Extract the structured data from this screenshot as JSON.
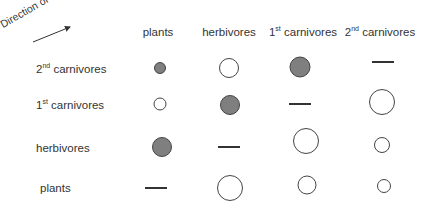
{
  "diagram": {
    "axis_label": "Direction of impact",
    "columns": [
      {
        "id": "plants",
        "label": "plants",
        "sup": "",
        "label_rest": "",
        "x": 158
      },
      {
        "id": "herbivores",
        "label": "herbivores",
        "sup": "",
        "label_rest": "",
        "x": 229
      },
      {
        "id": "carn1",
        "label": "1",
        "sup": "st",
        "label_rest": " carnivores",
        "x": 303
      },
      {
        "id": "carn2",
        "label": "2",
        "sup": "nd",
        "label_rest": " carnivores",
        "x": 380
      }
    ],
    "rows": [
      {
        "id": "carn2",
        "label": "2",
        "sup": "nd",
        "label_rest": " carnivores",
        "y": 69
      },
      {
        "id": "carn1",
        "label": "1",
        "sup": "st",
        "label_rest": " carnivores",
        "y": 105
      },
      {
        "id": "herbivores",
        "label": "herbivores",
        "sup": "",
        "label_rest": "",
        "y": 148
      },
      {
        "id": "plants",
        "label": "plants",
        "sup": "",
        "label_rest": "",
        "y": 188
      }
    ],
    "cells": [
      {
        "row": "carn2",
        "col": "plants",
        "type": "filled",
        "size": 12,
        "x": 160,
        "y": 68
      },
      {
        "row": "carn2",
        "col": "herbivores",
        "type": "open",
        "size": 20,
        "x": 229,
        "y": 68
      },
      {
        "row": "carn2",
        "col": "carn1",
        "type": "filled",
        "size": 21,
        "x": 300,
        "y": 67
      },
      {
        "row": "carn2",
        "col": "carn2",
        "type": "dash",
        "size": 22,
        "x": 383,
        "y": 62
      },
      {
        "row": "carn1",
        "col": "plants",
        "type": "open",
        "size": 13,
        "x": 160,
        "y": 104
      },
      {
        "row": "carn1",
        "col": "herbivores",
        "type": "filled",
        "size": 20,
        "x": 230,
        "y": 105
      },
      {
        "row": "carn1",
        "col": "carn1",
        "type": "dash",
        "size": 22,
        "x": 300,
        "y": 104
      },
      {
        "row": "carn1",
        "col": "carn2",
        "type": "open",
        "size": 26,
        "x": 382,
        "y": 102
      },
      {
        "row": "herbivores",
        "col": "plants",
        "type": "filled",
        "size": 20,
        "x": 162,
        "y": 147
      },
      {
        "row": "herbivores",
        "col": "herbivores",
        "type": "dash",
        "size": 22,
        "x": 229,
        "y": 147
      },
      {
        "row": "herbivores",
        "col": "carn1",
        "type": "open",
        "size": 26,
        "x": 306,
        "y": 141
      },
      {
        "row": "herbivores",
        "col": "carn2",
        "type": "open",
        "size": 16,
        "x": 382,
        "y": 145
      },
      {
        "row": "plants",
        "col": "plants",
        "type": "dash",
        "size": 22,
        "x": 156,
        "y": 188
      },
      {
        "row": "plants",
        "col": "herbivores",
        "type": "open",
        "size": 26,
        "x": 230,
        "y": 188
      },
      {
        "row": "plants",
        "col": "carn1",
        "type": "open",
        "size": 19,
        "x": 307,
        "y": 185
      },
      {
        "row": "plants",
        "col": "carn2",
        "type": "open",
        "size": 14,
        "x": 384,
        "y": 186
      }
    ],
    "legend": {
      "filled": "negative effect (filled grey circle)",
      "open": "positive effect (open circle)",
      "dash": "no self-effect (dash)"
    },
    "colors": {
      "filled": "#7f7f7f",
      "stroke": "#444444",
      "text": "#333333"
    }
  }
}
